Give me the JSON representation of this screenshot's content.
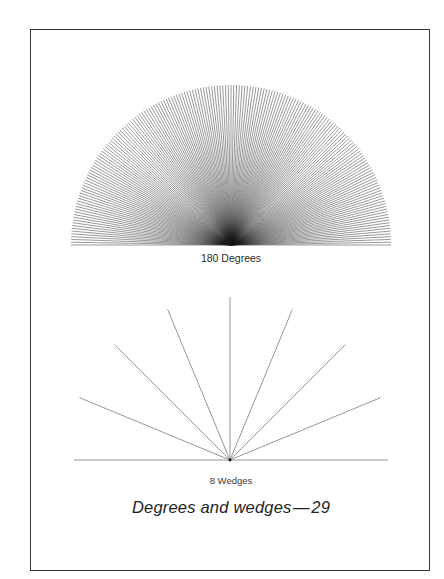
{
  "figure": {
    "caption": "Degrees and wedges — 29",
    "page_number": "29",
    "colors": {
      "ink": "#1a1a1a",
      "frame": "#333333",
      "wedge_lines": "#8a8a8a"
    }
  },
  "degrees_fan": {
    "label": "180 Degrees",
    "line_count": 181,
    "angle_step_deg": 1,
    "center": [
      231,
      245
    ],
    "radius": 160
  },
  "wedges_fan": {
    "label": "8 Wedges",
    "wedge_count": 8,
    "angle_step_deg": 22.5,
    "center": [
      230,
      460
    ],
    "ray_length": 163,
    "baseline": [
      74,
      388
    ]
  }
}
